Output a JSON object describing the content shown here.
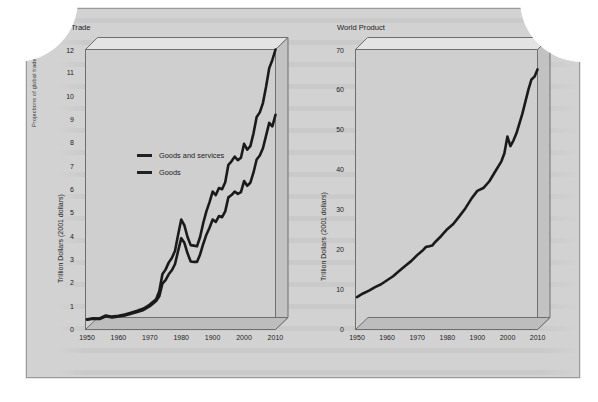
{
  "figure": {
    "side_caption": "Projections of global trade trends from WTO, and trends in world product from OECD and IMF",
    "bottom_caption": ""
  },
  "charts": [
    {
      "id": "trade",
      "title": "Trade",
      "ylabel": "Trillion Dollars (2001 dollars)",
      "yticks": [
        "0",
        "1",
        "2",
        "3",
        "4",
        "5",
        "6",
        "7",
        "8",
        "9",
        "10",
        "11",
        "12"
      ],
      "xticks": [
        "1950",
        "1960",
        "1970",
        "1980",
        "1900",
        "2000",
        "2010"
      ],
      "legend": [
        {
          "label": "Goods and services",
          "color": "#1a1a1a"
        },
        {
          "label": "Goods",
          "color": "#1a1a1a"
        }
      ]
    },
    {
      "id": "world",
      "title": "World Product",
      "ylabel": "Trillion Dollars (2001 dollars)",
      "yticks": [
        "0",
        "10",
        "20",
        "30",
        "40",
        "50",
        "60",
        "70"
      ],
      "xticks": [
        "1950",
        "1960",
        "1970",
        "1980",
        "1900",
        "2000",
        "2010"
      ],
      "legend": []
    }
  ],
  "chart_data": [
    {
      "type": "line",
      "title": "Trade",
      "xlabel": "",
      "ylabel": "Trillion Dollars (2001 dollars)",
      "xlim": [
        1950,
        2010
      ],
      "ylim": [
        0,
        12
      ],
      "grid": false,
      "legend_position": "inside-upper-left",
      "categories": [
        1950,
        1952,
        1954,
        1956,
        1958,
        1960,
        1962,
        1964,
        1966,
        1968,
        1970,
        1972,
        1973,
        1974,
        1975,
        1976,
        1977,
        1978,
        1979,
        1980,
        1981,
        1982,
        1983,
        1984,
        1985,
        1986,
        1987,
        1988,
        1989,
        1990,
        1991,
        1992,
        1993,
        1994,
        1995,
        1996,
        1997,
        1998,
        1999,
        2000,
        2001,
        2002,
        2003,
        2004,
        2005,
        2006,
        2007,
        2008,
        2009,
        2010
      ],
      "series": [
        {
          "name": "Goods and services",
          "values": [
            0.42,
            0.46,
            0.45,
            0.58,
            0.53,
            0.57,
            0.62,
            0.7,
            0.78,
            0.88,
            1.05,
            1.28,
            1.62,
            2.35,
            2.55,
            2.85,
            3.05,
            3.35,
            4.05,
            4.7,
            4.45,
            3.95,
            3.6,
            3.58,
            3.55,
            3.95,
            4.55,
            5.05,
            5.45,
            5.9,
            5.75,
            6.05,
            6.0,
            6.3,
            7.05,
            7.2,
            7.4,
            7.25,
            7.35,
            7.95,
            7.7,
            7.85,
            8.4,
            9.1,
            9.3,
            9.7,
            10.4,
            11.2,
            11.55,
            12.0
          ]
        },
        {
          "name": "Goods",
          "values": [
            0.4,
            0.44,
            0.43,
            0.55,
            0.5,
            0.54,
            0.58,
            0.66,
            0.73,
            0.82,
            0.98,
            1.2,
            1.4,
            1.95,
            2.1,
            2.35,
            2.52,
            2.78,
            3.35,
            3.9,
            3.7,
            3.25,
            2.9,
            2.88,
            2.88,
            3.2,
            3.65,
            4.05,
            4.35,
            4.7,
            4.6,
            4.85,
            4.8,
            5.05,
            5.65,
            5.75,
            5.9,
            5.8,
            5.88,
            6.35,
            6.15,
            6.28,
            6.72,
            7.28,
            7.45,
            7.76,
            8.3,
            8.85,
            8.7,
            9.2
          ]
        }
      ]
    },
    {
      "type": "line",
      "title": "World Product",
      "xlabel": "",
      "ylabel": "Trillion Dollars (2001 dollars)",
      "xlim": [
        1950,
        2010
      ],
      "ylim": [
        0,
        70
      ],
      "grid": false,
      "legend_position": "none",
      "categories": [
        1950,
        1952,
        1954,
        1956,
        1958,
        1960,
        1962,
        1964,
        1966,
        1968,
        1970,
        1972,
        1973,
        1974,
        1975,
        1976,
        1978,
        1980,
        1982,
        1984,
        1986,
        1988,
        1990,
        1992,
        1994,
        1996,
        1998,
        1999,
        2000,
        2001,
        2002,
        2003,
        2004,
        2005,
        2006,
        2007,
        2008,
        2009,
        2010
      ],
      "series": [
        {
          "name": "World Product",
          "values": [
            8.0,
            8.9,
            9.6,
            10.5,
            11.2,
            12.2,
            13.2,
            14.5,
            15.8,
            17.0,
            18.5,
            19.8,
            20.6,
            20.7,
            20.9,
            21.8,
            23.3,
            25.0,
            26.3,
            28.2,
            30.2,
            32.6,
            34.6,
            35.3,
            37.0,
            39.5,
            42.0,
            44.0,
            48.2,
            45.8,
            47.2,
            49.0,
            51.5,
            54.0,
            57.0,
            60.0,
            62.5,
            63.2,
            65.0
          ]
        }
      ]
    }
  ]
}
